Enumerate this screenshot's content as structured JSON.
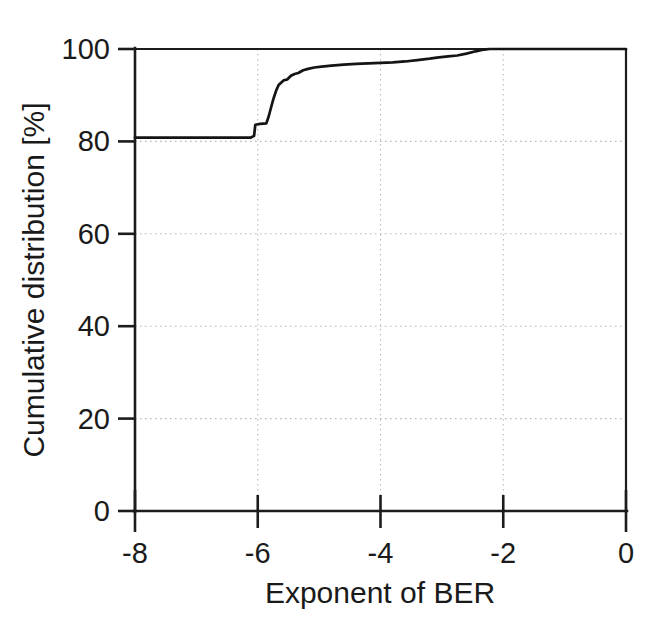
{
  "chart_data": {
    "type": "line",
    "title": "",
    "subtitle": "",
    "xlabel": "Exponent of BER",
    "ylabel": "Cumulative distribution [%]",
    "xlim": [
      -8,
      0
    ],
    "ylim": [
      0,
      100
    ],
    "xticks": [
      -8,
      -6,
      -4,
      -2,
      0
    ],
    "xticklabels": [
      "-8",
      "-6",
      "-4",
      "-2",
      "0"
    ],
    "yticks": [
      0,
      20,
      40,
      60,
      80,
      100
    ],
    "yticklabels": [
      "0",
      "20",
      "40",
      "60",
      "80",
      "100"
    ],
    "grid": true,
    "grid_style": "dotted",
    "legend": null,
    "series": [
      {
        "name": "Cumulative distribution of BER",
        "style": "step-like monotonic CDF",
        "color": "#141414",
        "x": [
          -8.0,
          -7.5,
          -7.0,
          -6.6,
          -6.3,
          -6.12,
          -6.06,
          -6.04,
          -5.96,
          -5.86,
          -5.82,
          -5.78,
          -5.74,
          -5.7,
          -5.66,
          -5.62,
          -5.58,
          -5.52,
          -5.46,
          -5.4,
          -5.34,
          -5.26,
          -5.18,
          -5.08,
          -4.96,
          -4.8,
          -4.6,
          -4.4,
          -4.2,
          -4.0,
          -3.8,
          -3.6,
          -3.4,
          -3.2,
          -3.05,
          -2.9,
          -2.75,
          -2.6,
          -2.45,
          -2.35,
          -2.28,
          -2.22,
          -2.1,
          -1.8,
          -1.4,
          -1.0,
          -0.6,
          -0.2,
          0.0
        ],
        "y": [
          80.8,
          80.8,
          80.8,
          80.8,
          80.8,
          80.8,
          81.2,
          83.6,
          83.8,
          83.9,
          85.5,
          87.5,
          89.4,
          91.0,
          92.2,
          92.7,
          93.2,
          93.4,
          94.2,
          94.6,
          94.8,
          95.4,
          95.7,
          96.0,
          96.2,
          96.4,
          96.6,
          96.8,
          96.9,
          97.0,
          97.1,
          97.3,
          97.6,
          97.9,
          98.2,
          98.4,
          98.6,
          99.0,
          99.5,
          99.8,
          99.9,
          100.0,
          100.0,
          100.0,
          100.0,
          100.0,
          100.0,
          100.0,
          100.0
        ]
      }
    ],
    "annotations": []
  },
  "figure": {
    "background_color": "#ffffff",
    "axis_color": "#1c1c1c",
    "grid_color": "#b9b9b9",
    "curve_color": "#141414"
  }
}
